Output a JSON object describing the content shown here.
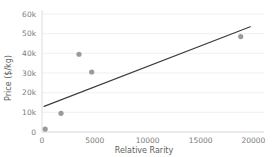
{
  "chart_data": {
    "type": "scatter",
    "title": "",
    "xlabel": "Relative Rarity",
    "ylabel": "Price ($/kg)",
    "xlim": [
      0,
      21000
    ],
    "ylim": [
      0,
      62000
    ],
    "grid": true,
    "legend": false,
    "x_ticks": [
      0,
      5000,
      10000,
      15000,
      20000
    ],
    "x_tick_labels": [
      "0",
      "5000",
      "10000",
      "15000",
      "20000"
    ],
    "y_ticks": [
      0,
      10000,
      20000,
      30000,
      40000,
      50000,
      60000
    ],
    "y_tick_labels": [
      "0",
      "10k",
      "20k",
      "30k",
      "40k",
      "50k",
      "60k"
    ],
    "point_color": "#9a9a9a",
    "trend_color": "#3d3d3d",
    "grid_color": "#ececec",
    "series": [
      {
        "name": "Elements",
        "type": "scatter",
        "points": [
          {
            "x": 300,
            "y": 1500
          },
          {
            "x": 1800,
            "y": 9500
          },
          {
            "x": 3500,
            "y": 39500
          },
          {
            "x": 4700,
            "y": 30500
          },
          {
            "x": 18800,
            "y": 48500
          }
        ]
      },
      {
        "name": "Trend line",
        "type": "line",
        "points": [
          {
            "x": 200,
            "y": 13000
          },
          {
            "x": 19700,
            "y": 53500
          }
        ]
      }
    ]
  }
}
